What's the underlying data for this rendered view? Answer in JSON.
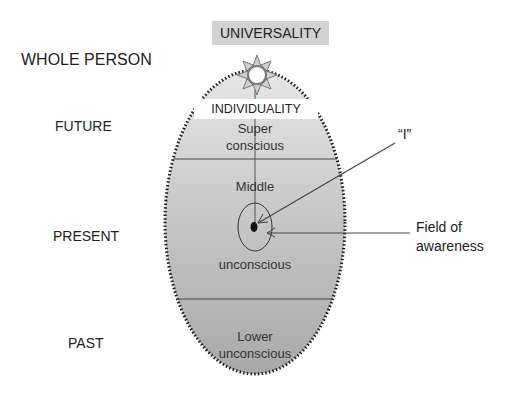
{
  "diagram": {
    "top_box": "UNIVERSALITY",
    "individuality_box": "INDIVIDUALITY",
    "left_labels": {
      "whole_person": "WHOLE PERSON",
      "future": "FUTURE",
      "present": "PRESENT",
      "past": "PAST"
    },
    "regions": {
      "super_line1": "Super",
      "super_line2": "conscious",
      "middle_top": "Middle",
      "middle_bottom": "unconscious",
      "lower_line1": "Lower",
      "lower_line2": "unconscious"
    },
    "callouts": {
      "i_label": "“I”",
      "field_line1": "Field of",
      "field_line2": "awareness"
    },
    "icons": {
      "star": "sun-star-icon"
    },
    "colors": {
      "egg_top": "#e4e4e4",
      "egg_bottom": "#a9a9a9",
      "box_fill": "#d3d3d3",
      "dots": "#1a1a1a",
      "line": "#444444"
    }
  }
}
